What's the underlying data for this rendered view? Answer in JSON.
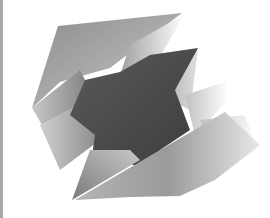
{
  "image": {
    "description": "Abstract grayscale geometric artwork of folded gradient polygon facets surrounding a dark star-like center",
    "caption": "Abstract gray geometric facets",
    "colors": {
      "background": "#ffffff",
      "edge_bar": "#a8a8a8",
      "dark_core": "#4a4a4a",
      "mid_gray": "#8a8a8a",
      "light_gray": "#d8d8d8"
    }
  }
}
